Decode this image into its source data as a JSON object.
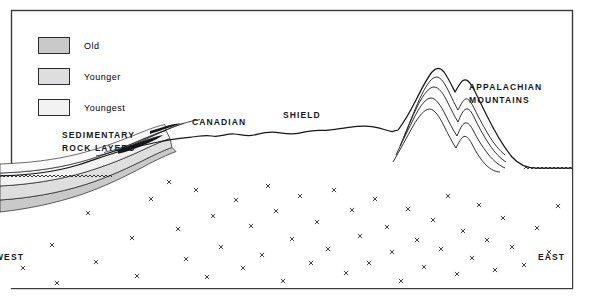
{
  "diagram": {
    "frame_color": "#3a3a3e",
    "background_color": "#ffffff",
    "line_color": "#17171a"
  },
  "legend": {
    "items": [
      {
        "label": "Old",
        "swatch_color": "#c9c9c9",
        "border_color": "#2b2b2f"
      },
      {
        "label": "Younger",
        "swatch_color": "#dedede",
        "border_color": "#2b2b2f"
      },
      {
        "label": "Youngest",
        "swatch_color": "#f2f2f2",
        "border_color": "#2b2b2f"
      }
    ]
  },
  "labels": {
    "sedimentary_line1": "SEDIMENTARY",
    "sedimentary_line2": "ROCK  LAYERS",
    "canadian": "CANADIAN",
    "shield": "SHIELD",
    "appalachian_line1": "APPALACHIAN",
    "appalachian_line2": "MOUNTAINS",
    "west": "WEST",
    "east": "EAST"
  },
  "features": {
    "basement_symbol": "x",
    "basement_symbol_count": 52,
    "water_line_left": "wavy-water-line",
    "water_line_right": "wavy-water-line",
    "mountain_peaks": 2,
    "sediment_layer_count": 4,
    "fold_arc_count": 5
  },
  "chart_data": {
    "type": "line",
    "xlabel": "",
    "ylabel": "",
    "annotations": [
      "SEDIMENTARY ROCK LAYERS",
      "CANADIAN SHIELD",
      "APPALACHIAN MOUNTAINS",
      "WEST",
      "EAST"
    ],
    "series": [
      {
        "name": "Land surface profile",
        "x": [
          0,
          60,
          110,
          150,
          175,
          200,
          225,
          250,
          275,
          300,
          325,
          350,
          370,
          390,
          410,
          430,
          445,
          460,
          475,
          500,
          530,
          572
        ],
        "y": [
          176,
          174,
          160,
          143,
          138,
          136,
          133,
          136,
          132,
          134,
          131,
          128,
          126,
          131,
          103,
          72,
          92,
          80,
          110,
          150,
          168,
          168
        ]
      },
      {
        "name": "Sediment layer 1 (Youngest)",
        "x": [
          0,
          40,
          80,
          110,
          140,
          165
        ],
        "y": [
          172,
          170,
          165,
          158,
          148,
          140
        ]
      },
      {
        "name": "Sediment layer 2 (Younger)",
        "x": [
          0,
          40,
          80,
          110,
          140,
          165
        ],
        "y": [
          185,
          183,
          177,
          168,
          155,
          143
        ]
      },
      {
        "name": "Sediment layer 3 (Old)",
        "x": [
          0,
          40,
          80,
          110,
          140,
          168
        ],
        "y": [
          200,
          197,
          190,
          179,
          163,
          147
        ]
      },
      {
        "name": "Sediment base (unconformity)",
        "x": [
          0,
          40,
          80,
          110,
          140,
          172
        ],
        "y": [
          216,
          212,
          204,
          191,
          172,
          151
        ]
      }
    ],
    "ylim": [
      308,
      0
    ],
    "xlim": [
      0,
      595
    ],
    "grid": false,
    "legend": {
      "position": "top-left",
      "entries": [
        "Old",
        "Younger",
        "Youngest"
      ]
    }
  }
}
